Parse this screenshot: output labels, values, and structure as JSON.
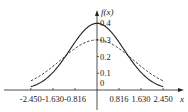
{
  "chart_data": {
    "type": "line",
    "title": "",
    "xlabel": "x",
    "ylabel": "f(x)",
    "x_ticks": [
      "-2.450",
      "-1.630",
      "-0.816",
      "0.816",
      "1.630",
      "2.450"
    ],
    "x_tick_values": [
      -2.45,
      -1.63,
      -0.816,
      0.816,
      1.63,
      2.45
    ],
    "y_ticks": [
      "0",
      "0.1",
      "0.2",
      "0.3",
      "0.4"
    ],
    "y_tick_values": [
      0,
      0.1,
      0.2,
      0.3,
      0.4
    ],
    "xlim": [
      -2.45,
      2.45
    ],
    "ylim": [
      0,
      0.4
    ],
    "grid": false,
    "legend": "none",
    "series": [
      {
        "name": "solid curve",
        "style": "solid",
        "peak": 0.4,
        "x": [
          -2.45,
          -2.0,
          -1.63,
          -1.2,
          -0.816,
          -0.4,
          0,
          0.4,
          0.816,
          1.2,
          1.63,
          2.0,
          2.45
        ],
        "values": [
          0.02,
          0.054,
          0.106,
          0.194,
          0.286,
          0.368,
          0.399,
          0.368,
          0.286,
          0.194,
          0.106,
          0.054,
          0.02
        ]
      },
      {
        "name": "dashed curve",
        "style": "dashed",
        "peak": 0.3,
        "x": [
          -2.45,
          -2.0,
          -1.63,
          -1.2,
          -0.816,
          -0.4,
          0,
          0.4,
          0.816,
          1.2,
          1.63,
          2.0,
          2.45
        ],
        "values": [
          0.015,
          0.039,
          0.072,
          0.124,
          0.179,
          0.229,
          0.3,
          0.229,
          0.179,
          0.124,
          0.072,
          0.039,
          0.015
        ]
      }
    ]
  },
  "labels": {
    "y_axis": "f(x)",
    "x_axis": "x",
    "origin": "0"
  },
  "colors": {
    "line": "#222222",
    "axis": "#222222"
  }
}
